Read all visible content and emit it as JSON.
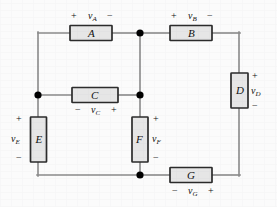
{
  "figure": {
    "kind": "electrical-schematic",
    "wire_color": "#8a8a8a",
    "box_fill": "#e6e6e6",
    "box_stroke": "#2b2b2b",
    "node_color": "#000000",
    "text_color": "#111111"
  },
  "elements": {
    "a": {
      "name": "A",
      "voltage": "v",
      "voltage_sub": "A",
      "plus": "+",
      "minus": "−"
    },
    "b": {
      "name": "B",
      "voltage": "v",
      "voltage_sub": "B",
      "plus": "+",
      "minus": "−"
    },
    "c": {
      "name": "C",
      "voltage": "v",
      "voltage_sub": "C",
      "plus": "+",
      "minus": "−"
    },
    "d": {
      "name": "D",
      "voltage": "v",
      "voltage_sub": "D",
      "plus": "+",
      "minus": "−"
    },
    "e": {
      "name": "E",
      "voltage": "v",
      "voltage_sub": "E",
      "plus": "+",
      "minus": "−"
    },
    "f": {
      "name": "F",
      "voltage": "v",
      "voltage_sub": "F",
      "plus": "+",
      "minus": "−"
    },
    "g": {
      "name": "G",
      "voltage": "v",
      "voltage_sub": "G",
      "plus": "+",
      "minus": "−"
    }
  }
}
